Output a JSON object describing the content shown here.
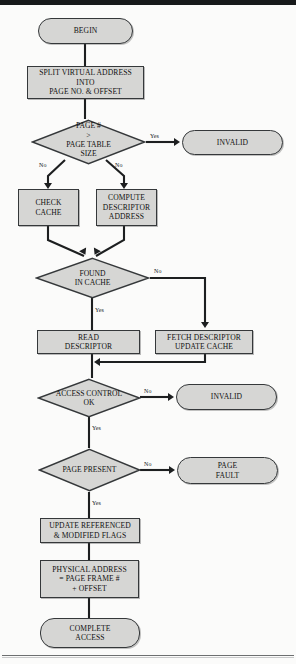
{
  "figure": {
    "type": "flowchart",
    "fill_color": "#d6d6d4",
    "stroke_color": "#35383a",
    "nodes": [
      {
        "id": "begin",
        "shape": "terminator",
        "text": "BEGIN"
      },
      {
        "id": "split",
        "shape": "process",
        "line1": "SPLIT VIRTUAL ADDRESS",
        "line2": "INTO",
        "line3": "PAGE NO. & OFFSET"
      },
      {
        "id": "pagechk",
        "shape": "decision",
        "line1": "PAGE #",
        "line2": ">",
        "line3": "PAGE TABLE",
        "line4": "SIZE"
      },
      {
        "id": "invalid1",
        "shape": "terminator",
        "text": "INVALID"
      },
      {
        "id": "checkcache",
        "shape": "process",
        "line1": "CHECK",
        "line2": "CACHE"
      },
      {
        "id": "computedesc",
        "shape": "process",
        "line1": "COMPUTE",
        "line2": "DESCRIPTOR",
        "line3": "ADDRESS"
      },
      {
        "id": "found",
        "shape": "decision",
        "line1": "FOUND",
        "line2": "IN CACHE"
      },
      {
        "id": "readdesc",
        "shape": "process",
        "line1": "READ",
        "line2": "DESCRIPTOR"
      },
      {
        "id": "fetchdesc",
        "shape": "process",
        "line1": "FETCH DESCRIPTOR",
        "line2": "UPDATE CACHE"
      },
      {
        "id": "access",
        "shape": "decision",
        "line1": "ACCESS CONTROL",
        "line2": "OK"
      },
      {
        "id": "invalid2",
        "shape": "terminator",
        "text": "INVALID"
      },
      {
        "id": "present",
        "shape": "decision",
        "line1": "PAGE PRESENT"
      },
      {
        "id": "pagefault",
        "shape": "terminator",
        "line1": "PAGE",
        "line2": "FAULT"
      },
      {
        "id": "update",
        "shape": "process",
        "line1": "UPDATE REFERENCED",
        "line2": "& MODIFIED FLAGS"
      },
      {
        "id": "physaddr",
        "shape": "process",
        "line1": "PHYSICAL ADDRESS",
        "line2": "= PAGE FRAME #",
        "line3": "+ OFFSET"
      },
      {
        "id": "complete",
        "shape": "terminator",
        "line1": "COMPLETE",
        "line2": "ACCESS"
      }
    ],
    "edge_labels": {
      "pagechk_yes": "Yes",
      "pagechk_no_left": "No",
      "pagechk_no_right": "No",
      "found_no": "No",
      "found_yes": "Yes",
      "access_no": "No",
      "access_yes": "Yes",
      "present_no": "No",
      "present_yes": "Yes"
    }
  }
}
